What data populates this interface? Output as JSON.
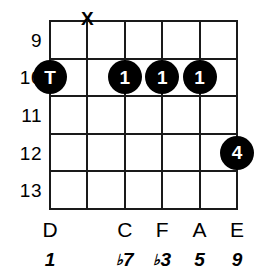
{
  "diagram": {
    "type": "guitar-chord-diagram",
    "strings_count": 6,
    "frets_count": 5,
    "colors": {
      "background": "#ffffff",
      "lines": "#1a1a1a",
      "dot_fill": "#000000",
      "dot_text": "#ffffff",
      "text": "#000000"
    }
  },
  "fret_numbers": [
    {
      "label": "9",
      "fret": 9
    },
    {
      "label": "10",
      "fret": 10
    },
    {
      "label": "11",
      "fret": 11
    },
    {
      "label": "12",
      "fret": 12
    },
    {
      "label": "13",
      "fret": 13
    }
  ],
  "markers": {
    "muted": [
      {
        "string_index": 1,
        "symbol": "X"
      }
    ],
    "dots": [
      {
        "string_index": 0,
        "fret": 10,
        "label": "T",
        "finger": "thumb"
      },
      {
        "string_index": 2,
        "fret": 10,
        "label": "1",
        "finger": "index"
      },
      {
        "string_index": 3,
        "fret": 10,
        "label": "1",
        "finger": "index"
      },
      {
        "string_index": 4,
        "fret": 10,
        "label": "1",
        "finger": "index"
      },
      {
        "string_index": 5,
        "fret": 12,
        "label": "4",
        "finger": "pinky"
      }
    ]
  },
  "note_labels": [
    {
      "string_index": 0,
      "label": "D"
    },
    {
      "string_index": 1,
      "label": ""
    },
    {
      "string_index": 2,
      "label": "C"
    },
    {
      "string_index": 3,
      "label": "F"
    },
    {
      "string_index": 4,
      "label": "A"
    },
    {
      "string_index": 5,
      "label": "E"
    }
  ],
  "interval_labels": [
    {
      "string_index": 0,
      "flat": "",
      "degree": "1"
    },
    {
      "string_index": 1,
      "flat": "",
      "degree": ""
    },
    {
      "string_index": 2,
      "flat": "♭",
      "degree": "7"
    },
    {
      "string_index": 3,
      "flat": "♭",
      "degree": "3"
    },
    {
      "string_index": 4,
      "flat": "",
      "degree": "5"
    },
    {
      "string_index": 5,
      "flat": "",
      "degree": "9"
    }
  ]
}
